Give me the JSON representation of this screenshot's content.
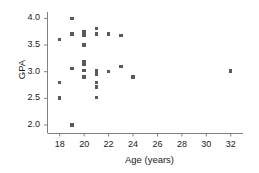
{
  "chart_data": {
    "type": "scatter",
    "title": "",
    "xlabel": "Age (years)",
    "ylabel": "GPA",
    "xlim": [
      17.0,
      33.0
    ],
    "ylim": [
      1.85,
      4.12
    ],
    "xticks": [
      18,
      20,
      22,
      24,
      26,
      28,
      30,
      32
    ],
    "xticklabels": [
      "18",
      "20",
      "22",
      "24",
      "26",
      "28",
      "30",
      "32"
    ],
    "yticks": [
      2.0,
      2.5,
      3.0,
      3.5,
      4.0
    ],
    "yticklabels": [
      "2.0",
      "2.5",
      "3.0",
      "3.5",
      "4.0"
    ],
    "grid": false,
    "legend": null,
    "marker": "square",
    "marker_color": "#5a5a5a",
    "marker_size": 3.4,
    "axis_color": "#808080",
    "points": [
      {
        "x": 18,
        "y": 3.6
      },
      {
        "x": 18,
        "y": 2.8
      },
      {
        "x": 18,
        "y": 2.51
      },
      {
        "x": 19,
        "y": 4.0
      },
      {
        "x": 19,
        "y": 3.71
      },
      {
        "x": 19,
        "y": 3.06
      },
      {
        "x": 19,
        "y": 2.0
      },
      {
        "x": 20,
        "y": 3.76
      },
      {
        "x": 20,
        "y": 3.72
      },
      {
        "x": 20,
        "y": 3.68
      },
      {
        "x": 20,
        "y": 3.5
      },
      {
        "x": 20,
        "y": 3.19
      },
      {
        "x": 20,
        "y": 3.14
      },
      {
        "x": 20,
        "y": 3.02
      },
      {
        "x": 20,
        "y": 2.9
      },
      {
        "x": 21,
        "y": 3.81
      },
      {
        "x": 21,
        "y": 3.71
      },
      {
        "x": 21,
        "y": 3.02
      },
      {
        "x": 21,
        "y": 2.96
      },
      {
        "x": 21,
        "y": 2.8
      },
      {
        "x": 21,
        "y": 2.71
      },
      {
        "x": 21,
        "y": 2.52
      },
      {
        "x": 22,
        "y": 3.71
      },
      {
        "x": 22,
        "y": 3.0
      },
      {
        "x": 23,
        "y": 3.68
      },
      {
        "x": 23,
        "y": 3.1
      },
      {
        "x": 24,
        "y": 2.9
      },
      {
        "x": 32,
        "y": 3.01
      }
    ]
  }
}
